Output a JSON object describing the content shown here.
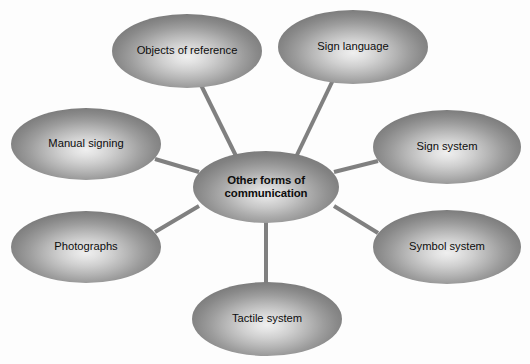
{
  "diagram": {
    "type": "spider-map",
    "title_node": "Other forms of communication",
    "background_color": "#fdfdfd",
    "edge_color": "#808080",
    "node_text_color": "#0d0d0d",
    "hub": {
      "id": "hub",
      "label": "Other forms of\ncommunication",
      "label_plain": "Other forms of communication",
      "cx": 266,
      "cy": 187,
      "rx": 73,
      "ry": 36,
      "bold": true
    },
    "satellites": [
      {
        "id": "objects-of-reference",
        "label": "Objects of reference",
        "cx": 187,
        "cy": 51,
        "rx": 75,
        "ry": 37,
        "edge": {
          "x1": 200,
          "y1": 83,
          "x2": 236,
          "y2": 156
        }
      },
      {
        "id": "sign-language",
        "label": "Sign language",
        "cx": 353,
        "cy": 47,
        "rx": 75,
        "ry": 37,
        "edge": {
          "x1": 333,
          "y1": 80,
          "x2": 296,
          "y2": 157
        }
      },
      {
        "id": "sign-system",
        "label": "Sign system",
        "cx": 447,
        "cy": 147,
        "rx": 74,
        "ry": 37,
        "edge": {
          "x1": 378,
          "y1": 161,
          "x2": 334,
          "y2": 172
        }
      },
      {
        "id": "symbol-system",
        "label": "Symbol system",
        "cx": 447,
        "cy": 247,
        "rx": 74,
        "ry": 37,
        "edge": {
          "x1": 378,
          "y1": 233,
          "x2": 334,
          "y2": 206
        }
      },
      {
        "id": "tactile-system",
        "label": "Tactile system",
        "cx": 267,
        "cy": 319,
        "rx": 75,
        "ry": 37,
        "edge": {
          "x1": 266,
          "y1": 285,
          "x2": 266,
          "y2": 222
        }
      },
      {
        "id": "photographs",
        "label": "Photographs",
        "cx": 86,
        "cy": 247,
        "rx": 75,
        "ry": 36,
        "edge": {
          "x1": 155,
          "y1": 232,
          "x2": 199,
          "y2": 206
        }
      },
      {
        "id": "manual-signing",
        "label": "Manual signing",
        "cx": 86,
        "cy": 144,
        "rx": 75,
        "ry": 36,
        "edge": {
          "x1": 155,
          "y1": 159,
          "x2": 199,
          "y2": 172
        }
      }
    ]
  }
}
